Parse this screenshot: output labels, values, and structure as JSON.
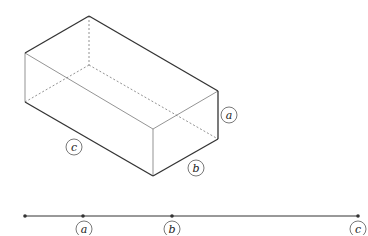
{
  "diagram": {
    "type": "rectangular-prism-with-number-line",
    "box_labels": {
      "height": "a",
      "depth": "b",
      "length": "c"
    },
    "number_line": {
      "points": [
        "",
        "a",
        "b",
        "c"
      ],
      "labels": [
        "a",
        "b",
        "c"
      ]
    },
    "colors": {
      "line": "#333333",
      "background": "#ffffff"
    }
  }
}
